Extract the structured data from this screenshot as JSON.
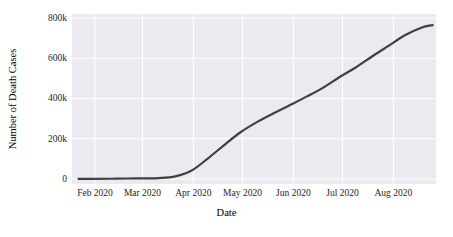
{
  "chart_data": {
    "type": "line",
    "title": "",
    "xlabel": "Date",
    "ylabel": "Number of Death Cases",
    "grid": true,
    "legend": false,
    "line_color": "#404040",
    "plot_background": "#eaeaf0",
    "grid_color": "#ffffff",
    "figure_background": "#ffffff",
    "xlim": [
      "2020-01-18",
      "2020-08-27"
    ],
    "ylim": [
      -25000,
      820000
    ],
    "xticks": [
      "Feb 2020",
      "Mar 2020",
      "Apr 2020",
      "May 2020",
      "Jun 2020",
      "Jul 2020",
      "Aug 2020"
    ],
    "xtick_dates": [
      "2020-02-01",
      "2020-03-01",
      "2020-04-01",
      "2020-05-01",
      "2020-06-01",
      "2020-07-01",
      "2020-08-01"
    ],
    "yticks": [
      0,
      200000,
      400000,
      600000,
      800000
    ],
    "ytick_labels": [
      "0",
      "200k",
      "400k",
      "600k",
      "800k"
    ],
    "x": [
      "2020-01-22",
      "2020-02-01",
      "2020-02-11",
      "2020-02-21",
      "2020-03-01",
      "2020-03-11",
      "2020-03-21",
      "2020-03-31",
      "2020-04-10",
      "2020-04-20",
      "2020-04-30",
      "2020-05-10",
      "2020-05-20",
      "2020-05-30",
      "2020-06-09",
      "2020-06-19",
      "2020-06-29",
      "2020-07-09",
      "2020-07-19",
      "2020-07-29",
      "2020-08-08",
      "2020-08-18",
      "2020-08-25"
    ],
    "values": [
      17,
      259,
      1013,
      2247,
      2996,
      4615,
      13049,
      42107,
      102687,
      169986,
      233360,
      283735,
      326682,
      367166,
      409419,
      452822,
      505518,
      553975,
      608907,
      661503,
      714000,
      752000,
      765000
    ],
    "series": [
      {
        "name": "Number of Death Cases",
        "color": "#404040",
        "linewidth": 2.2
      }
    ],
    "annotations": []
  }
}
